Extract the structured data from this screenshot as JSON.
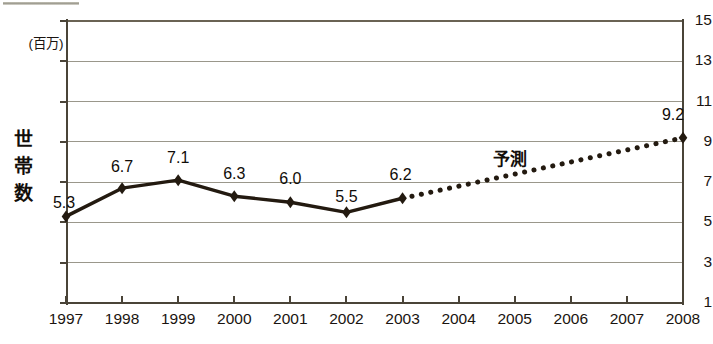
{
  "chart_data": {
    "type": "line",
    "title": "",
    "subtitle": "",
    "xlabel": "",
    "ylabel": "世帯数",
    "unit_note": "(百万)",
    "categories": [
      "1997",
      "1998",
      "1999",
      "2000",
      "2001",
      "2002",
      "2003",
      "2004",
      "2005",
      "2006",
      "2007",
      "2008"
    ],
    "x_tick_labels": [
      "1997",
      "1998",
      "1999",
      "2000",
      "2001",
      "2002",
      "2003",
      "2004",
      "2005",
      "2006",
      "2007",
      "2008"
    ],
    "y_tick_labels": [
      "15",
      "13",
      "11",
      "9",
      "7",
      "5",
      "3",
      "1"
    ],
    "y_ticks": [
      15,
      13,
      11,
      9,
      7,
      5,
      3,
      1
    ],
    "ylim": [
      1,
      15
    ],
    "grid": true,
    "grid_axis": "y",
    "legend": false,
    "legend_position": "none",
    "series": [
      {
        "name": "実績",
        "style": "solid",
        "color": "#231a10",
        "marker": "diamond",
        "points": [
          {
            "x": "1997",
            "y": 5.3,
            "label": "5.3"
          },
          {
            "x": "1998",
            "y": 6.7,
            "label": "6.7"
          },
          {
            "x": "1999",
            "y": 7.1,
            "label": "7.1"
          },
          {
            "x": "2000",
            "y": 6.3,
            "label": "6.3"
          },
          {
            "x": "2001",
            "y": 6.0,
            "label": "6.0"
          },
          {
            "x": "2002",
            "y": 5.5,
            "label": "5.5"
          },
          {
            "x": "2003",
            "y": 6.2,
            "label": "6.2"
          }
        ]
      },
      {
        "name": "予測",
        "style": "dotted",
        "color": "#231a10",
        "marker": "diamond",
        "points": [
          {
            "x": "2003",
            "y": 6.2,
            "label": ""
          },
          {
            "x": "2008",
            "y": 9.2,
            "label": "9.2"
          }
        ]
      }
    ],
    "annotations": [
      {
        "text": "予測",
        "x": "2005",
        "y": 8.1
      }
    ],
    "data_labels": [
      "5.3",
      "6.7",
      "7.1",
      "6.3",
      "6.0",
      "5.5",
      "6.2",
      "9.2"
    ],
    "colors": {
      "line": "#231a10",
      "gridline": "#9a978b",
      "axis": "#4a4438",
      "text": "#1a1410",
      "background": "#ffffff"
    }
  }
}
